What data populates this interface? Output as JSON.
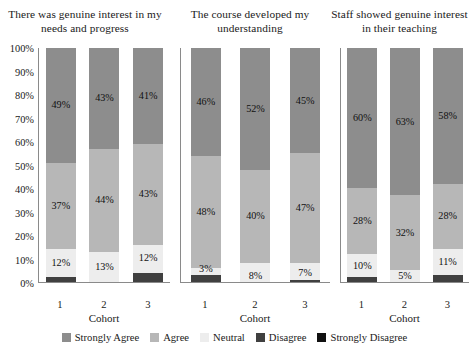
{
  "chart_data": {
    "type": "bar",
    "subtype": "100% stacked bar, 3 panels",
    "title": "",
    "xlabel": "Cohort",
    "ylabel": "",
    "ylim": [
      0,
      100
    ],
    "ytick_labels": [
      "100%",
      "90%",
      "80%",
      "70%",
      "60%",
      "50%",
      "40%",
      "30%",
      "20%",
      "10%",
      "0%"
    ],
    "ytick_values": [
      100,
      90,
      80,
      70,
      60,
      50,
      40,
      30,
      20,
      10,
      0
    ],
    "grid": false,
    "legend_position": "bottom",
    "categories": [
      "1",
      "2",
      "3"
    ],
    "series": [
      {
        "name": "Strongly Agree",
        "color": "#8d8d8d"
      },
      {
        "name": "Agree",
        "color": "#b7b7b7"
      },
      {
        "name": "Neutral",
        "color": "#ededed"
      },
      {
        "name": "Disagree",
        "color": "#404040"
      },
      {
        "name": "Strongly Disagree",
        "color": "#111111"
      }
    ],
    "panels": [
      {
        "title": "There was genuine interest in my needs and progress",
        "xlabel": "Cohort",
        "bars": [
          {
            "category": "1",
            "values": {
              "Strongly Agree": 49,
              "Agree": 37,
              "Neutral": 12,
              "Disagree": 2,
              "Strongly Disagree": 0
            },
            "labels": {
              "Strongly Agree": "49%",
              "Agree": "37%",
              "Neutral": "12%",
              "Disagree": "",
              "Strongly Disagree": ""
            }
          },
          {
            "category": "2",
            "values": {
              "Strongly Agree": 43,
              "Agree": 44,
              "Neutral": 13,
              "Disagree": 0,
              "Strongly Disagree": 0
            },
            "labels": {
              "Strongly Agree": "43%",
              "Agree": "44%",
              "Neutral": "13%",
              "Disagree": "",
              "Strongly Disagree": ""
            }
          },
          {
            "category": "3",
            "values": {
              "Strongly Agree": 41,
              "Agree": 43,
              "Neutral": 12,
              "Disagree": 4,
              "Strongly Disagree": 0
            },
            "labels": {
              "Strongly Agree": "41%",
              "Agree": "43%",
              "Neutral": "12%",
              "Disagree": "",
              "Strongly Disagree": ""
            }
          }
        ]
      },
      {
        "title": "The course developed my understanding",
        "xlabel": "Cohort",
        "bars": [
          {
            "category": "1",
            "values": {
              "Strongly Agree": 46,
              "Agree": 48,
              "Neutral": 3,
              "Disagree": 3,
              "Strongly Disagree": 0
            },
            "labels": {
              "Strongly Agree": "46%",
              "Agree": "48%",
              "Neutral": "3%",
              "Disagree": "",
              "Strongly Disagree": ""
            }
          },
          {
            "category": "2",
            "values": {
              "Strongly Agree": 52,
              "Agree": 40,
              "Neutral": 8,
              "Disagree": 0,
              "Strongly Disagree": 0
            },
            "labels": {
              "Strongly Agree": "52%",
              "Agree": "40%",
              "Neutral": "8%",
              "Disagree": "",
              "Strongly Disagree": ""
            }
          },
          {
            "category": "3",
            "values": {
              "Strongly Agree": 45,
              "Agree": 47,
              "Neutral": 7,
              "Disagree": 1,
              "Strongly Disagree": 0
            },
            "labels": {
              "Strongly Agree": "45%",
              "Agree": "47%",
              "Neutral": "7%",
              "Disagree": "",
              "Strongly Disagree": ""
            }
          }
        ]
      },
      {
        "title": "Staff showed genuine interest in their teaching",
        "xlabel": "Cohort",
        "bars": [
          {
            "category": "1",
            "values": {
              "Strongly Agree": 60,
              "Agree": 28,
              "Neutral": 10,
              "Disagree": 2,
              "Strongly Disagree": 0
            },
            "labels": {
              "Strongly Agree": "60%",
              "Agree": "28%",
              "Neutral": "10%",
              "Disagree": "",
              "Strongly Disagree": ""
            }
          },
          {
            "category": "2",
            "values": {
              "Strongly Agree": 63,
              "Agree": 32,
              "Neutral": 5,
              "Disagree": 0,
              "Strongly Disagree": 0
            },
            "labels": {
              "Strongly Agree": "63%",
              "Agree": "32%",
              "Neutral": "5%",
              "Disagree": "",
              "Strongly Disagree": ""
            }
          },
          {
            "category": "3",
            "values": {
              "Strongly Agree": 58,
              "Agree": 28,
              "Neutral": 11,
              "Disagree": 3,
              "Strongly Disagree": 0
            },
            "labels": {
              "Strongly Agree": "58%",
              "Agree": "28%",
              "Neutral": "11%",
              "Disagree": "",
              "Strongly Disagree": ""
            }
          }
        ]
      }
    ],
    "legend": [
      {
        "label": "Strongly Agree",
        "color": "#8d8d8d"
      },
      {
        "label": "Agree",
        "color": "#b7b7b7"
      },
      {
        "label": "Neutral",
        "color": "#ededed"
      },
      {
        "label": "Disagree",
        "color": "#404040"
      },
      {
        "label": "Strongly Disagree",
        "color": "#111111"
      }
    ]
  }
}
